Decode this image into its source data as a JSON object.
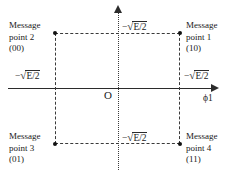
{
  "figure": {
    "type": "signal-constellation-diagram",
    "origin_label": "O",
    "axis_label_x": "ϕ1",
    "axes": {
      "x_style": "solid-with-arrow",
      "y_style": "dotted-with-arrow"
    },
    "coordinates": {
      "top": "−√E/2",
      "bottom": "−√E/2",
      "left": "−√E/2",
      "right": "−√E/2",
      "radical_symbol": "√",
      "radicand_top": "E/2",
      "radicand_bottom": "E/2",
      "radicand_left": "E/2",
      "radicand_right": "E/2",
      "sign_top": "−",
      "sign_bottom": "−",
      "sign_left": "−",
      "sign_right": "−"
    },
    "message_points": [
      {
        "id": "point-1",
        "position": "top-right",
        "line1": "Message",
        "line2": "point 1",
        "bits": "(10)"
      },
      {
        "id": "point-2",
        "position": "top-left",
        "line1": "Message",
        "line2": "point 2",
        "bits": "(00)"
      },
      {
        "id": "point-3",
        "position": "bottom-left",
        "line1": "Message",
        "line2": "point 3",
        "bits": "(01)"
      },
      {
        "id": "point-4",
        "position": "bottom-right",
        "line1": "Message",
        "line2": "point 4",
        "bits": "(11)"
      }
    ]
  },
  "chart_data": {
    "type": "scatter",
    "title": "",
    "xlabel": "ϕ1",
    "ylabel": "",
    "grid": false,
    "legend": null,
    "annotations": [
      "−√E/2",
      "−√E/2",
      "−√E/2",
      "−√E/2",
      "O"
    ],
    "xlim": [
      -1.6,
      1.6
    ],
    "ylim": [
      -1.6,
      1.6
    ],
    "xticks": [
      "−√E/2",
      "−√E/2"
    ],
    "yticks": [
      "−√E/2",
      "−√E/2"
    ],
    "series": [
      {
        "name": "Message points",
        "points": [
          {
            "label": "Message point 2 (00)",
            "bits": "00",
            "x": -1,
            "y": 1
          },
          {
            "label": "Message point 1 (10)",
            "bits": "10",
            "x": 1,
            "y": 1
          },
          {
            "label": "Message point 3 (01)",
            "bits": "01",
            "x": -1,
            "y": -1
          },
          {
            "label": "Message point 4 (11)",
            "bits": "11",
            "x": 1,
            "y": -1
          }
        ]
      }
    ]
  }
}
